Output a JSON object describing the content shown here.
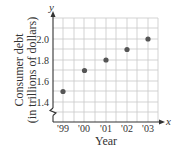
{
  "chart_data": {
    "type": "scatter",
    "title": "",
    "xlabel": "Year",
    "ylabel": "Consumer debt (in trillions of dollars)",
    "ylabel_lines": [
      "Consumer debt",
      "(in trillions of dollars)"
    ],
    "x_axis_var": "x",
    "y_axis_var": "y",
    "categories": [
      "'99",
      "'00",
      "'01",
      "'02",
      "'03"
    ],
    "values": [
      1.5,
      1.7,
      1.8,
      1.9,
      2.0
    ],
    "y_ticks": [
      "1.4",
      "1.6",
      "1.8",
      "2.0"
    ],
    "ylim": [
      1.2,
      2.2
    ],
    "y_axis_break": true,
    "grid": true,
    "legend": null,
    "point_color": "#555555",
    "grid_color": "#c8c8c8",
    "axis_color": "#333333"
  }
}
